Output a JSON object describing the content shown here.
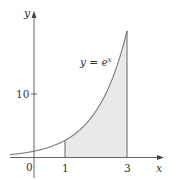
{
  "chart_data": {
    "type": "area",
    "title": "",
    "function_label": "y = e^x",
    "function_label_base": "y = e",
    "function_label_exp": "x",
    "xlabel": "x",
    "ylabel": "y",
    "origin_label": "0",
    "x_ticks": [
      {
        "value": 1,
        "label": "1"
      },
      {
        "value": 3,
        "label": "3"
      }
    ],
    "y_ticks": [
      {
        "value": 10,
        "label": "10"
      }
    ],
    "shaded_region": {
      "from": 1,
      "to": 3,
      "description": "area under y = e^x from x = 1 to x = 3"
    },
    "xlim": [
      -0.8,
      4.2
    ],
    "ylim": [
      -3,
      23
    ],
    "grid": false,
    "legend": "none",
    "series": [
      {
        "name": "y = e^x",
        "x": [
          -0.8,
          0,
          0.5,
          1,
          1.5,
          2,
          2.5,
          3
        ],
        "values": [
          0.45,
          1,
          1.65,
          2.72,
          4.48,
          7.39,
          12.18,
          20.09
        ]
      }
    ],
    "colors": {
      "curve": "#7a7a7a",
      "fill": "#e9e9e9",
      "axes": "#555555"
    }
  }
}
